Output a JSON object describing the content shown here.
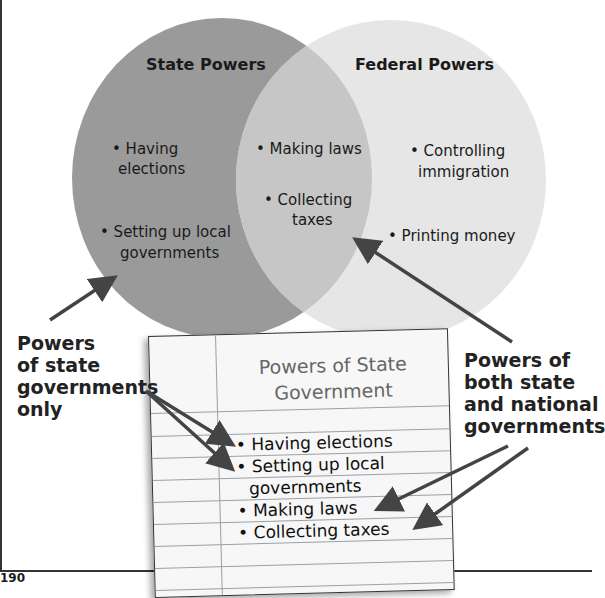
{
  "venn": {
    "left": {
      "title": "State Powers",
      "items": [
        "• Having",
        "elections",
        "• Setting up local",
        "governments"
      ]
    },
    "overlap": {
      "items": [
        "• Making laws",
        "• Collecting",
        "taxes"
      ]
    },
    "right": {
      "title": "Federal Powers",
      "items": [
        "• Controlling",
        "immigration",
        "• Printing money"
      ]
    },
    "colors": {
      "state": "#9a9a9a",
      "federal": "#e6e6e6",
      "overlap": "#c4c4c4"
    }
  },
  "callouts": {
    "state_only": [
      "Powers",
      "of state",
      "governments",
      "only"
    ],
    "both": [
      "Powers of",
      "both state",
      "and national",
      "governments"
    ]
  },
  "notebook": {
    "title_line1": "Powers of State",
    "title_line2": "Government",
    "items": [
      "• Having elections",
      "• Setting up local",
      "governments",
      "• Making laws",
      "• Collecting taxes"
    ]
  },
  "page_number": "190"
}
